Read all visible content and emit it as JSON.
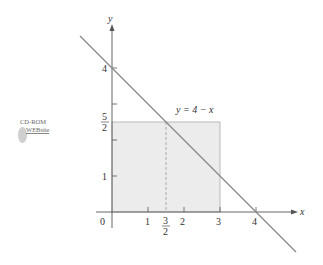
{
  "figure": {
    "equation_label": "y = 4 − x",
    "x_axis_label": "x",
    "y_axis_label": "y",
    "x_ticks": [
      {
        "value": 0,
        "label": "0"
      },
      {
        "value": 1,
        "label": "1"
      },
      {
        "value": 1.5,
        "label_num": "3",
        "label_den": "2"
      },
      {
        "value": 2,
        "label": "2"
      },
      {
        "value": 3,
        "label": "3"
      },
      {
        "value": 4,
        "label": "4"
      }
    ],
    "y_ticks": [
      {
        "value": 1,
        "label": "1"
      },
      {
        "value": 2,
        "label": ""
      },
      {
        "value": 2.5,
        "label_num": "5",
        "label_den": "2"
      },
      {
        "value": 3,
        "label": ""
      },
      {
        "value": 4,
        "label": "4"
      }
    ],
    "shaded_rectangle": {
      "x0": 0,
      "x1": 3,
      "y0": 0,
      "y1": 2.5
    },
    "dashed_line_x": 1.5,
    "colors": {
      "shade": "#ececec",
      "line": "#888888",
      "axis": "#555555"
    }
  },
  "badge": {
    "line1": "CD-ROM",
    "line2": "WEBsite"
  }
}
